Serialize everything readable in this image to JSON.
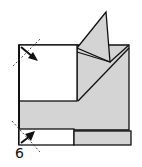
{
  "diagram": {
    "type": "origami-folding-step",
    "step_label": "6",
    "colors": {
      "paper_colored_side": "#d4d4d4",
      "paper_white_side": "#ffffff",
      "line": "#111111",
      "fold_guide": "#333333"
    },
    "elements": [
      {
        "name": "white-square-flap",
        "desc": "upper-left white square"
      },
      {
        "name": "gray-base",
        "desc": "gray colored paper body"
      },
      {
        "name": "triangle-flap",
        "desc": "gray triangular point sticking up"
      },
      {
        "name": "bottom-white-strip",
        "desc": "white strip at bottom left"
      },
      {
        "name": "bottom-gray-strip",
        "desc": "gray strip at bottom right"
      },
      {
        "name": "fold-arrow-top",
        "desc": "valley fold arrow at top-left corner"
      },
      {
        "name": "fold-arrow-bottom",
        "desc": "valley fold arrow at bottom-left corner"
      }
    ]
  }
}
